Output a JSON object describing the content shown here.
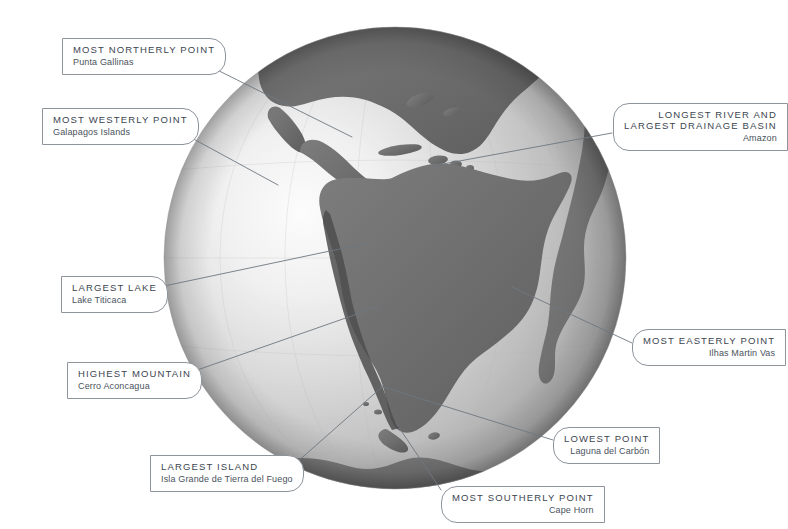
{
  "figure": {
    "kind": "globe-infographic",
    "accent_line_color": "#6e7780",
    "label_border_color": "#8e949c",
    "label_title_color": "#3b4450",
    "label_sub_color": "#4a525c",
    "background_color": "#ffffff"
  },
  "globe": {
    "ocean_light": "#f2f2f2",
    "ocean_mid": "#bfbfbf",
    "ocean_dark": "#8a8a8a",
    "land_color": "#6f6f6f",
    "land_shadow": "#4f4f4f",
    "center_x": 395,
    "center_y": 258,
    "radius": 231
  },
  "callouts": [
    {
      "id": "most-northerly-point",
      "title": "MOST NORTHERLY POINT",
      "subtitle": "Punta Gallinas",
      "side": "left"
    },
    {
      "id": "most-westerly-point",
      "title": "MOST WESTERLY POINT",
      "subtitle": "Galapagos Islands",
      "side": "left"
    },
    {
      "id": "longest-river-largest-drainage-basin",
      "title_line_1": "LONGEST RIVER AND",
      "title_line_2": "LARGEST DRAINAGE BASIN",
      "subtitle": "Amazon",
      "side": "right"
    },
    {
      "id": "largest-lake",
      "title": "LARGEST LAKE",
      "subtitle": "Lake Titicaca",
      "side": "left"
    },
    {
      "id": "most-easterly-point",
      "title": "MOST EASTERLY POINT",
      "subtitle": "Ilhas Martin Vas",
      "side": "right"
    },
    {
      "id": "highest-mountain",
      "title": "HIGHEST MOUNTAIN",
      "subtitle": "Cerro Aconcagua",
      "side": "left"
    },
    {
      "id": "lowest-point",
      "title": "LOWEST POINT",
      "subtitle": "Laguna del Carbón",
      "side": "right"
    },
    {
      "id": "largest-island",
      "title": "LARGEST ISLAND",
      "subtitle": "Isla Grande de Tierra del Fuego",
      "side": "left"
    },
    {
      "id": "most-southerly-point",
      "title": "MOST SOUTHERLY POINT",
      "subtitle": "Cape Horn",
      "side": "right"
    }
  ]
}
